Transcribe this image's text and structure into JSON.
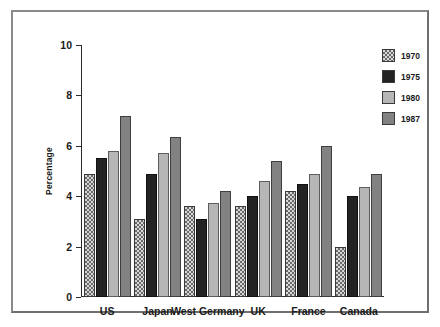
{
  "chart_data": {
    "type": "bar",
    "title": "",
    "xlabel": "",
    "ylabel": "Percentage",
    "ylim": [
      0,
      10
    ],
    "yticks": [
      "0",
      "2",
      "4",
      "6",
      "8",
      "10"
    ],
    "grid": false,
    "legend_position": "right",
    "categories": [
      "US",
      "Japan",
      "West Germany",
      "UK",
      "France",
      "Canada"
    ],
    "series": [
      {
        "name": "1970",
        "values": [
          4.9,
          3.1,
          3.6,
          3.6,
          4.2,
          2.0
        ]
      },
      {
        "name": "1975",
        "values": [
          5.5,
          4.9,
          3.1,
          4.0,
          4.5,
          4.0
        ]
      },
      {
        "name": "1980",
        "values": [
          5.8,
          5.7,
          3.75,
          4.6,
          4.9,
          4.35
        ]
      },
      {
        "name": "1987",
        "values": [
          7.2,
          6.35,
          4.2,
          5.4,
          6.0,
          4.9
        ]
      }
    ]
  }
}
